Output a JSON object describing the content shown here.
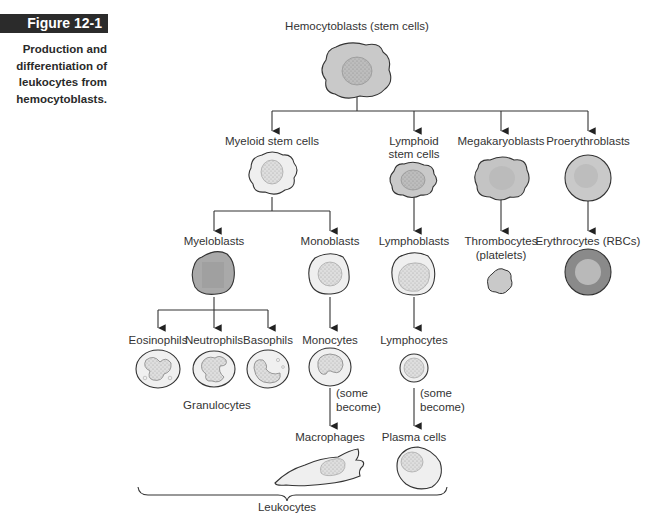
{
  "figure": {
    "label": "Figure 12-1",
    "caption_lines": [
      "Production and",
      "differentiation of",
      "leukocytes from",
      "hemocytoblasts."
    ]
  },
  "nodes": {
    "hemocytoblasts": "Hemocytoblasts (stem cells)",
    "myeloid": "Myeloid stem cells",
    "lymphoid_1": "Lymphoid",
    "lymphoid_2": "stem cells",
    "megakaryoblasts": "Megakaryoblasts",
    "proerythroblasts": "Proerythroblasts",
    "myeloblasts": "Myeloblasts",
    "monoblasts": "Monoblasts",
    "lymphoblasts": "Lymphoblasts",
    "thrombocytes_1": "Thrombocytes",
    "thrombocytes_2": "(platelets)",
    "erythrocytes": "Erythrocytes (RBCs)",
    "eosinophils": "Eosinophils",
    "neutrophils": "Neutrophils",
    "basophils": "Basophils",
    "monocytes": "Monocytes",
    "lymphocytes": "Lymphocytes",
    "granulocytes": "Granulocytes",
    "some_1": "(some",
    "become_1": "become)",
    "some_2": "(some",
    "become_2": "become)",
    "macrophages": "Macrophages",
    "plasma_cells": "Plasma cells",
    "leukocytes": "Leukocytes"
  },
  "colors": {
    "badge_bg": "#2b2b2b",
    "cell_gray": "#c9c9c9",
    "cell_light": "#ececec",
    "nucleus": "#b4b4b4",
    "rbc_outer": "#8a8a8a",
    "rbc_inner": "#b9b9b9"
  }
}
